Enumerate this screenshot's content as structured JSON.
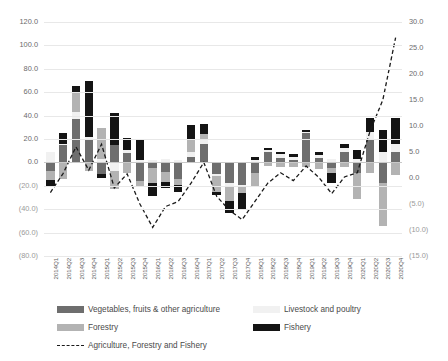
{
  "chart_data": {
    "type": "bar",
    "subtype": "stacked-bar-with-line",
    "title": "",
    "xlabel": "",
    "ylabel": "",
    "categories": [
      "2014Q1",
      "2014Q2",
      "2014Q3",
      "2014Q4",
      "2015Q1",
      "2015Q2",
      "2015Q3",
      "2015Q4",
      "2016Q1",
      "2016Q2",
      "2016Q3",
      "2016Q4",
      "2017Q1",
      "2017Q2",
      "2017Q3",
      "2017Q4",
      "2018Q1",
      "2018Q2",
      "2018Q3",
      "2018Q4",
      "2019Q1",
      "2019Q2",
      "2019Q3",
      "2019Q4",
      "2020Q1",
      "2020Q2",
      "2020Q3",
      "2020Q4"
    ],
    "primary_axis": {
      "label": "",
      "ylim": [
        -80,
        120
      ],
      "ticks": [
        "120.0",
        "100.0",
        "80.0",
        "60.0",
        "40.0",
        "20.0",
        "0.0",
        "(20.0)",
        "(40.0)",
        "(60.0)",
        "(80.0)"
      ],
      "tick_values": [
        120,
        100,
        80,
        60,
        40,
        20,
        0,
        -20,
        -40,
        -60,
        -80
      ]
    },
    "secondary_axis": {
      "label": "",
      "ylim": [
        -15,
        30
      ],
      "ticks": [
        "30.0",
        "25.0",
        "20.0",
        "15.0",
        "10.0",
        "5.0",
        "0.0",
        "(5.0)",
        "(10.0)",
        "(15.0)"
      ],
      "tick_values": [
        30,
        25,
        20,
        15,
        10,
        5,
        0,
        -5,
        -10,
        -15
      ]
    },
    "grid": true,
    "legend_position": "bottom",
    "series": [
      {
        "name": "Vegetables, fruits & other agriculture",
        "color": "#6e6e6e",
        "axis": "primary",
        "type": "bar",
        "values": [
          -7.0,
          15.0,
          37.0,
          19.0,
          -10.0,
          15.0,
          8.0,
          -16.0,
          -5.0,
          -8.0,
          -14.0,
          5.0,
          16.0,
          -10.0,
          -18.0,
          -19.0,
          -9.0,
          9.0,
          4.0,
          2.0,
          25.0,
          4.0,
          -5.0,
          9.0,
          -9.0,
          20.0,
          -18.0,
          9.0
        ]
      },
      {
        "name": "Livestock and poultry",
        "color": "#f1f1f1",
        "axis": "primary",
        "type": "bar",
        "values": [
          9.0,
          1.0,
          6.0,
          3.0,
          3.0,
          -7.0,
          3.0,
          2.0,
          2.0,
          3.0,
          2.0,
          4.0,
          4.0,
          -2.0,
          -3.0,
          -2.0,
          2.0,
          2.0,
          3.0,
          3.0,
          1.0,
          2.0,
          3.0,
          3.0,
          3.0,
          6.0,
          9.0,
          7.0
        ]
      },
      {
        "name": "Forestry",
        "color": "#b3b3b3",
        "axis": "primary",
        "type": "bar",
        "values": [
          -8.0,
          -14.0,
          17.0,
          -7.0,
          26.0,
          -16.0,
          -9.0,
          -4.0,
          -13.0,
          -9.0,
          -5.0,
          10.0,
          4.0,
          -13.0,
          -12.0,
          -5.0,
          -12.0,
          -3.0,
          -4.0,
          -4.0,
          -4.0,
          -6.0,
          -4.0,
          -4.0,
          -22.0,
          -9.0,
          -36.0,
          -11.0
        ]
      },
      {
        "name": "Fishery",
        "color": "#141414",
        "axis": "primary",
        "type": "bar",
        "values": [
          -6.0,
          9.0,
          5.0,
          48.0,
          -3.0,
          27.0,
          10.0,
          18.0,
          -11.0,
          -5.0,
          -6.0,
          13.0,
          9.0,
          -3.0,
          -10.0,
          -14.0,
          3.0,
          1.0,
          2.0,
          2.0,
          2.0,
          3.0,
          -9.0,
          4.0,
          8.0,
          12.0,
          19.0,
          22.0
        ]
      },
      {
        "name": "Agriculture, Forestry and Fishery",
        "color": "#1a1a1a",
        "axis": "secondary",
        "type": "line",
        "style": "dashed",
        "values": [
          -2.8,
          0.9,
          6.0,
          1.5,
          6.5,
          -1.9,
          0.8,
          -5.0,
          -9.5,
          -5.5,
          -4.5,
          -1.0,
          3.0,
          -3.5,
          -6.2,
          -8.0,
          -4.5,
          -1.0,
          1.0,
          -0.5,
          2.3,
          0.1,
          -3.0,
          0.2,
          1.0,
          9.0,
          15.0,
          27.0
        ]
      }
    ]
  },
  "legend": {
    "items": [
      {
        "label": "Vegetables, fruits & other agriculture",
        "kind": "swatch",
        "color": "#6e6e6e"
      },
      {
        "label": "Livestock and poultry",
        "kind": "swatch",
        "color": "#f1f1f1"
      },
      {
        "label": "Forestry",
        "kind": "swatch",
        "color": "#b3b3b3"
      },
      {
        "label": "Fishery",
        "kind": "swatch",
        "color": "#141414"
      },
      {
        "label": "Agriculture, Forestry and Fishery",
        "kind": "line",
        "color": "#1a1a1a"
      }
    ]
  }
}
